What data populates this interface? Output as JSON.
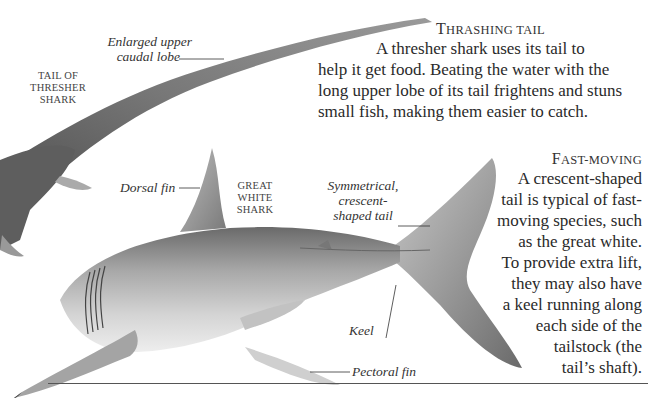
{
  "page": {
    "background": "#ffffff",
    "illustrations": [
      {
        "name": "thresher-shark-tail",
        "caption": "Tail of thresher shark"
      },
      {
        "name": "great-white-shark",
        "caption": "Great white shark"
      }
    ]
  },
  "thresher": {
    "caption_lines": [
      "Tail of",
      "thresher",
      "shark"
    ],
    "callout_upper_lobe": [
      "Enlarged upper",
      "caudal lobe"
    ]
  },
  "great_white": {
    "caption_lines": [
      "Great",
      "white",
      "shark"
    ],
    "callout_dorsal": "Dorsal fin",
    "callout_tail": [
      "Symmetrical,",
      "crescent-",
      "shaped tail"
    ],
    "callout_keel": "Keel",
    "callout_pectoral": "Pectoral fin"
  },
  "sections": [
    {
      "heading": "Thrashing tail",
      "lines": [
        "A thresher shark uses its tail to",
        "help it get food. Beating the water with the",
        "long upper lobe of its tail frightens and stuns",
        "small fish, making them easier to catch."
      ]
    },
    {
      "heading": "Fast-moving",
      "lines": [
        "A crescent-shaped",
        "tail is typical of fast-",
        "moving species, such",
        "as the great white.",
        "To provide extra lift,",
        "they may also have",
        "a keel running along",
        "each side of the",
        "tailstock (the",
        "tail’s shaft)."
      ]
    }
  ],
  "colors": {
    "text": "#2a2a2a",
    "shark_dark": "#5a5a5a",
    "shark_mid": "#9a9a9a",
    "shark_light": "#d8d8d8",
    "rule": "#555555"
  }
}
